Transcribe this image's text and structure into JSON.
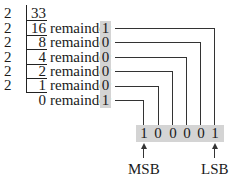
{
  "divisor": "2",
  "rows": [
    {
      "quotient": "33",
      "remainder_label": "",
      "remainder": ""
    },
    {
      "quotient": "16",
      "remainder_label": "remainder",
      "remainder": "1"
    },
    {
      "quotient": "8",
      "remainder_label": "remainder",
      "remainder": "0"
    },
    {
      "quotient": "4",
      "remainder_label": "remainder",
      "remainder": "0"
    },
    {
      "quotient": "2",
      "remainder_label": "remainder",
      "remainder": "0"
    },
    {
      "quotient": "1",
      "remainder_label": "remainder",
      "remainder": "0"
    },
    {
      "quotient": "0",
      "remainder_label": "remainder",
      "remainder": "1"
    }
  ],
  "binary_result": [
    "1",
    "0",
    "0",
    "0",
    "0",
    "1"
  ],
  "labels": {
    "msb": "MSB",
    "lsb": "LSB"
  },
  "colors": {
    "highlight": "#d4d4d4",
    "line": "#333333"
  }
}
